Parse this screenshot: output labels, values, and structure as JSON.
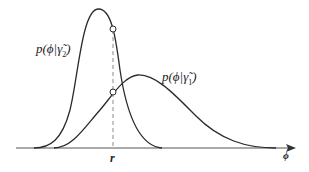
{
  "diagram": {
    "type": "overlapping probability density curves with threshold",
    "curves": [
      {
        "id": "gamma2",
        "label_prefix": "p(",
        "label_var": "ϕ",
        "label_cond": "|γ̃",
        "label_sub": "2",
        "label_suffix": ")",
        "shape": "narrow, tall, peak left"
      },
      {
        "id": "gamma1",
        "label_prefix": "p(",
        "label_var": "ϕ",
        "label_cond": "|γ̃",
        "label_sub": "1",
        "label_suffix": ")",
        "shape": "wide, lower, peak right"
      }
    ],
    "threshold": {
      "label": "r",
      "style": "dashed vertical"
    },
    "x_axis": {
      "label": "ϕ",
      "arrow": true
    },
    "markers": [
      "intersection of threshold with gamma2 curve",
      "intersection of threshold with gamma1 curve"
    ],
    "colors": {
      "line": "#2a2a2a",
      "dashed": "#888888",
      "background": "#ffffff"
    }
  }
}
